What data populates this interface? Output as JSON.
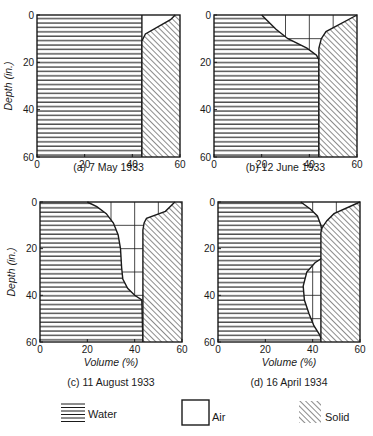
{
  "chart_data": [
    {
      "type": "area",
      "id": "a",
      "title": "(a) 7 May 1933",
      "xlabel": "",
      "ylabel": "Depth (in.)",
      "xlim": [
        0,
        60
      ],
      "ylim": [
        0,
        60
      ],
      "y_inverted": true,
      "x_ticks": [
        0,
        20,
        40,
        60
      ],
      "y_ticks": [
        0,
        20,
        40,
        60
      ],
      "air_grid": false,
      "series": [
        {
          "name": "Water (left boundary 0, right boundary = water curve)",
          "points": [
            [
              0,
              43
            ],
            [
              60,
              43
            ]
          ]
        },
        {
          "name": "Solid boundary",
          "points": [
            [
              0,
              58
            ],
            [
              2,
              56
            ],
            [
              8,
              45
            ],
            [
              11,
              44
            ],
            [
              60,
              44
            ]
          ]
        }
      ],
      "water_curve": [
        [
          0,
          44
        ],
        [
          60,
          44
        ]
      ],
      "solid_curve": [
        [
          0,
          58
        ],
        [
          2,
          56
        ],
        [
          8,
          45.5
        ],
        [
          11,
          44
        ],
        [
          60,
          44
        ]
      ]
    },
    {
      "type": "area",
      "id": "b",
      "title": "(b) 12 June 1933",
      "xlabel": "",
      "ylabel": "",
      "xlim": [
        0,
        60
      ],
      "ylim": [
        0,
        60
      ],
      "y_inverted": true,
      "x_ticks": [
        0,
        20,
        40,
        60
      ],
      "y_ticks": [
        0,
        20,
        40,
        60
      ],
      "air_grid": true,
      "water_curve": [
        [
          0,
          20
        ],
        [
          2,
          22
        ],
        [
          6,
          26
        ],
        [
          10,
          31
        ],
        [
          14,
          39
        ],
        [
          17,
          43
        ],
        [
          19,
          44
        ],
        [
          60,
          44
        ]
      ],
      "solid_curve": [
        [
          0,
          60
        ],
        [
          7,
          47
        ],
        [
          10,
          45
        ],
        [
          14,
          44
        ],
        [
          60,
          44
        ]
      ]
    },
    {
      "type": "area",
      "id": "c",
      "title": "(c) 11 August 1933",
      "xlabel": "Volume (%)",
      "ylabel": "Depth (in.)",
      "xlim": [
        0,
        60
      ],
      "ylim": [
        0,
        60
      ],
      "y_inverted": true,
      "x_ticks": [
        0,
        20,
        40,
        60
      ],
      "y_ticks": [
        0,
        20,
        40,
        60
      ],
      "air_grid": true,
      "water_curve": [
        [
          0,
          20
        ],
        [
          2,
          24
        ],
        [
          5,
          28
        ],
        [
          9,
          31
        ],
        [
          14,
          33
        ],
        [
          20,
          34
        ],
        [
          28,
          34.5
        ],
        [
          33,
          35
        ],
        [
          37,
          37
        ],
        [
          40,
          40
        ],
        [
          42,
          43
        ],
        [
          60,
          43.5
        ]
      ],
      "solid_curve": [
        [
          0,
          57
        ],
        [
          4,
          53
        ],
        [
          7,
          45
        ],
        [
          9,
          44
        ],
        [
          12,
          43.5
        ],
        [
          60,
          43.5
        ]
      ]
    },
    {
      "type": "area",
      "id": "d",
      "title": "(d) 16 April 1934",
      "xlabel": "Volume (%)",
      "ylabel": "",
      "xlim": [
        0,
        60
      ],
      "ylim": [
        0,
        60
      ],
      "y_inverted": true,
      "x_ticks": [
        0,
        20,
        40,
        60
      ],
      "y_ticks": [
        0,
        20,
        40,
        60
      ],
      "air_grid": true,
      "water_curve": [
        [
          0,
          35
        ],
        [
          3,
          39
        ],
        [
          6,
          42
        ],
        [
          10,
          43.5
        ],
        [
          13,
          44
        ],
        [
          24,
          44
        ],
        [
          26,
          41
        ],
        [
          30,
          37.5
        ],
        [
          36,
          36
        ],
        [
          42,
          36.5
        ],
        [
          48,
          38.5
        ],
        [
          53,
          40.5
        ],
        [
          57,
          43
        ],
        [
          60,
          44
        ]
      ],
      "solid_curve": [
        [
          0,
          60
        ],
        [
          5,
          49
        ],
        [
          8,
          46
        ],
        [
          11,
          44
        ],
        [
          13,
          43.5
        ],
        [
          60,
          43.5
        ]
      ]
    }
  ],
  "legend": {
    "items": [
      {
        "label": "Water",
        "pattern": "horizontal-lines"
      },
      {
        "label": "Air",
        "pattern": "empty-box"
      },
      {
        "label": "Solid",
        "pattern": "diagonal-hatch"
      }
    ]
  },
  "colors": {
    "ink": "#1a1a1a",
    "paper": "#ffffff"
  }
}
